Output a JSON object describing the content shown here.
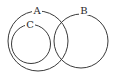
{
  "diagram": {
    "type": "venn",
    "sets": [
      {
        "id": "A",
        "label": "A",
        "cx": 38,
        "cy": 41,
        "r": 30,
        "label_x": 37,
        "label_y": 14
      },
      {
        "id": "B",
        "label": "B",
        "cx": 81,
        "cy": 41,
        "r": 27,
        "label_x": 84,
        "label_y": 14
      },
      {
        "id": "C",
        "label": "C",
        "cx": 31,
        "cy": 44,
        "r": 20,
        "label_x": 30,
        "label_y": 28
      }
    ],
    "relations": [
      "C is a subset of A",
      "A and B overlap",
      "C and B are disjoint"
    ],
    "stroke_color": "#3a3a3a"
  }
}
